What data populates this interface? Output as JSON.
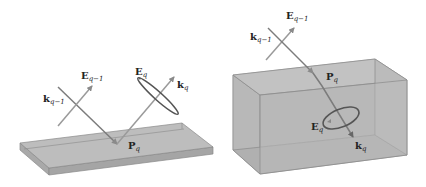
{
  "figure": {
    "left_panel": {
      "title": "Reflection at surface",
      "labels": {
        "E_prev": {
          "main": "E",
          "sub": "q−1"
        },
        "k_prev": {
          "main": "k",
          "sub": "q−1"
        },
        "E_cur": {
          "main": "E",
          "sub": "q"
        },
        "k_cur": {
          "main": "k",
          "sub": "q"
        },
        "P_cur": {
          "main": "P",
          "sub": "q"
        }
      }
    },
    "right_panel": {
      "title": "Refraction into volume",
      "labels": {
        "E_prev": {
          "main": "E",
          "sub": "q−1"
        },
        "k_prev": {
          "main": "k",
          "sub": "q−1"
        },
        "P_cur": {
          "main": "P",
          "sub": "q"
        },
        "E_cur": {
          "main": "E",
          "sub": "q"
        },
        "k_cur": {
          "main": "k",
          "sub": "q"
        }
      }
    },
    "colors": {
      "surface_fill": "#b9b9b9",
      "surface_edge": "#8a8a8a",
      "ray": "#7c7c7c",
      "vector_light": "#9a9a9a",
      "ellipse": "#555555"
    }
  }
}
